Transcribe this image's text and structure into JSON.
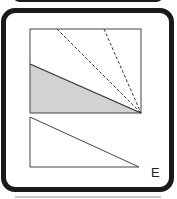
{
  "figure": {
    "label": "E",
    "colors": {
      "frame": "#1a1a1a",
      "line": "#333333",
      "shade": "#d2d2d2",
      "background": "#ffffff"
    },
    "square": {
      "x": 30,
      "y": 29,
      "width": 111,
      "height": 84
    },
    "dashed_lines": [
      {
        "from": [
          57,
          29
        ],
        "to": [
          141,
          113
        ]
      },
      {
        "from": [
          104,
          29
        ],
        "to": [
          141,
          113
        ]
      }
    ],
    "shaded_region": [
      [
        30,
        64
      ],
      [
        141,
        113
      ],
      [
        30,
        113
      ]
    ],
    "triangle": [
      [
        30,
        117
      ],
      [
        30,
        167
      ],
      [
        139,
        167
      ]
    ]
  }
}
